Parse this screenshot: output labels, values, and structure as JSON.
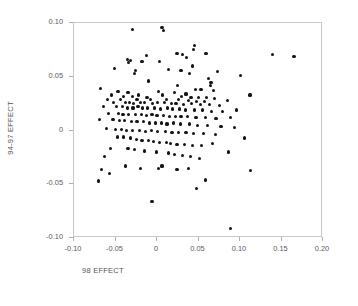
{
  "chart_data": {
    "type": "scatter",
    "title": "",
    "xlabel": "98 EFFECT",
    "ylabel": "94-97 EFFECT",
    "xlim": [
      -0.1,
      0.2
    ],
    "ylim": [
      -0.1,
      0.1
    ],
    "xticks": [
      -0.1,
      -0.05,
      0,
      0.05,
      0.1,
      0.15,
      0.2
    ],
    "xtick_labels": [
      "-0.10",
      "-0.05",
      "0",
      "0.05",
      "0.10",
      "0.15",
      "0.20"
    ],
    "yticks": [
      -0.1,
      -0.05,
      0,
      0.05,
      0.1
    ],
    "ytick_labels": [
      "-0.10",
      "-0.05",
      "0",
      "0.05",
      "0.10"
    ],
    "grid": false,
    "legend": "none",
    "marker": "filled-circle",
    "marker_color": "#141414",
    "frame_color": "#c8c8c8",
    "n_points": 182,
    "points": [
      [
        -0.03,
        0.094
      ],
      [
        0.006,
        0.096
      ],
      [
        0.008,
        0.093
      ],
      [
        0.045,
        0.079
      ],
      [
        0.044,
        0.075
      ],
      [
        0.139,
        0.071
      ],
      [
        0.165,
        0.069
      ],
      [
        0.024,
        0.072
      ],
      [
        0.059,
        0.072
      ],
      [
        0.031,
        0.071
      ],
      [
        -0.013,
        0.07
      ],
      [
        0.036,
        0.068
      ],
      [
        -0.036,
        0.066
      ],
      [
        -0.032,
        0.065
      ],
      [
        -0.018,
        0.064
      ],
      [
        0.003,
        0.064
      ],
      [
        -0.034,
        0.063
      ],
      [
        0.043,
        0.06
      ],
      [
        -0.051,
        0.058
      ],
      [
        -0.026,
        0.056
      ],
      [
        0.014,
        0.057
      ],
      [
        0.029,
        0.056
      ],
      [
        0.073,
        0.055
      ],
      [
        -0.027,
        0.053
      ],
      [
        0.039,
        0.053
      ],
      [
        0.101,
        0.051
      ],
      [
        0.062,
        0.048
      ],
      [
        -0.01,
        0.046
      ],
      [
        0.065,
        0.045
      ],
      [
        0.064,
        0.042
      ],
      [
        0.025,
        0.042
      ],
      [
        -0.068,
        0.039
      ],
      [
        0.046,
        0.038
      ],
      [
        0.053,
        0.038
      ],
      [
        0.068,
        0.037
      ],
      [
        -0.047,
        0.036
      ],
      [
        -0.035,
        0.035
      ],
      [
        0.002,
        0.036
      ],
      [
        0.021,
        0.035
      ],
      [
        0.035,
        0.034
      ],
      [
        0.112,
        0.033
      ],
      [
        -0.055,
        0.033
      ],
      [
        -0.04,
        0.032
      ],
      [
        -0.03,
        0.032
      ],
      [
        -0.022,
        0.033
      ],
      [
        -0.012,
        0.031
      ],
      [
        0.007,
        0.033
      ],
      [
        0.03,
        0.032
      ],
      [
        0.041,
        0.031
      ],
      [
        0.05,
        0.031
      ],
      [
        0.06,
        0.031
      ],
      [
        0.069,
        0.03
      ],
      [
        -0.06,
        0.029
      ],
      [
        -0.044,
        0.029
      ],
      [
        -0.024,
        0.029
      ],
      [
        -0.008,
        0.029
      ],
      [
        0.011,
        0.029
      ],
      [
        0.026,
        0.029
      ],
      [
        0.038,
        0.028
      ],
      [
        0.048,
        0.027
      ],
      [
        0.057,
        0.027
      ],
      [
        0.085,
        0.028
      ],
      [
        -0.052,
        0.026
      ],
      [
        -0.038,
        0.026
      ],
      [
        -0.033,
        0.026
      ],
      [
        -0.028,
        0.025
      ],
      [
        -0.02,
        0.026
      ],
      [
        -0.015,
        0.026
      ],
      [
        -0.005,
        0.025
      ],
      [
        0.001,
        0.026
      ],
      [
        0.009,
        0.026
      ],
      [
        0.017,
        0.025
      ],
      [
        0.023,
        0.025
      ],
      [
        0.032,
        0.024
      ],
      [
        0.042,
        0.025
      ],
      [
        0.052,
        0.024
      ],
      [
        0.063,
        0.024
      ],
      [
        0.075,
        0.023
      ],
      [
        -0.064,
        0.022
      ],
      [
        -0.049,
        0.022
      ],
      [
        -0.042,
        0.022
      ],
      [
        -0.036,
        0.021
      ],
      [
        -0.029,
        0.021
      ],
      [
        -0.023,
        0.022
      ],
      [
        -0.017,
        0.021
      ],
      [
        -0.011,
        0.021
      ],
      [
        -0.003,
        0.021
      ],
      [
        0.004,
        0.02
      ],
      [
        0.013,
        0.021
      ],
      [
        0.019,
        0.02
      ],
      [
        0.027,
        0.02
      ],
      [
        0.034,
        0.019
      ],
      [
        0.045,
        0.019
      ],
      [
        0.055,
        0.019
      ],
      [
        0.066,
        0.018
      ],
      [
        0.079,
        0.018
      ],
      [
        0.096,
        0.019
      ],
      [
        -0.058,
        0.016
      ],
      [
        -0.046,
        0.016
      ],
      [
        -0.041,
        0.015
      ],
      [
        -0.034,
        0.015
      ],
      [
        -0.026,
        0.015
      ],
      [
        -0.019,
        0.015
      ],
      [
        -0.013,
        0.014
      ],
      [
        -0.006,
        0.015
      ],
      [
        0.0,
        0.014
      ],
      [
        0.008,
        0.014
      ],
      [
        0.015,
        0.013
      ],
      [
        0.022,
        0.013
      ],
      [
        0.029,
        0.013
      ],
      [
        0.037,
        0.013
      ],
      [
        0.047,
        0.012
      ],
      [
        0.058,
        0.012
      ],
      [
        0.071,
        0.011
      ],
      [
        0.089,
        0.012
      ],
      [
        -0.069,
        0.01
      ],
      [
        -0.053,
        0.01
      ],
      [
        -0.045,
        0.009
      ],
      [
        -0.039,
        0.009
      ],
      [
        -0.031,
        0.008
      ],
      [
        -0.024,
        0.008
      ],
      [
        -0.016,
        0.008
      ],
      [
        -0.009,
        0.007
      ],
      [
        -0.002,
        0.007
      ],
      [
        0.005,
        0.007
      ],
      [
        0.012,
        0.006
      ],
      [
        0.02,
        0.007
      ],
      [
        0.028,
        0.006
      ],
      [
        0.039,
        0.006
      ],
      [
        0.049,
        0.005
      ],
      [
        0.061,
        0.005
      ],
      [
        0.077,
        0.004
      ],
      [
        0.093,
        0.003
      ],
      [
        -0.061,
        0.002
      ],
      [
        -0.05,
        0.001
      ],
      [
        -0.043,
        0.001
      ],
      [
        -0.037,
        0.0
      ],
      [
        -0.03,
        0.0
      ],
      [
        -0.021,
        0.0
      ],
      [
        -0.014,
        -0.001
      ],
      [
        -0.007,
        0.0
      ],
      [
        0.001,
        -0.001
      ],
      [
        0.01,
        -0.001
      ],
      [
        0.018,
        -0.002
      ],
      [
        0.026,
        -0.002
      ],
      [
        0.035,
        -0.002
      ],
      [
        0.044,
        -0.003
      ],
      [
        0.056,
        -0.003
      ],
      [
        0.07,
        -0.004
      ],
      [
        0.105,
        -0.007
      ],
      [
        -0.048,
        -0.006
      ],
      [
        -0.04,
        -0.006
      ],
      [
        -0.032,
        -0.007
      ],
      [
        -0.025,
        -0.008
      ],
      [
        -0.018,
        -0.009
      ],
      [
        -0.01,
        -0.009
      ],
      [
        -0.004,
        -0.01
      ],
      [
        0.003,
        -0.011
      ],
      [
        0.011,
        -0.011
      ],
      [
        0.016,
        -0.012
      ],
      [
        0.024,
        -0.013
      ],
      [
        0.033,
        -0.013
      ],
      [
        0.043,
        -0.014
      ],
      [
        0.054,
        -0.014
      ],
      [
        0.067,
        -0.012
      ],
      [
        0.086,
        -0.02
      ],
      [
        -0.056,
        -0.017
      ],
      [
        -0.035,
        -0.017
      ],
      [
        -0.027,
        -0.018
      ],
      [
        -0.015,
        -0.019
      ],
      [
        -0.001,
        -0.02
      ],
      [
        0.014,
        -0.021
      ],
      [
        0.021,
        -0.022
      ],
      [
        0.031,
        -0.023
      ],
      [
        0.04,
        -0.024
      ],
      [
        0.051,
        -0.026
      ],
      [
        -0.063,
        -0.024
      ],
      [
        0.006,
        -0.033
      ],
      [
        -0.02,
        -0.035
      ],
      [
        0.002,
        -0.035
      ],
      [
        -0.038,
        -0.033
      ],
      [
        -0.067,
        -0.036
      ],
      [
        -0.057,
        -0.04
      ],
      [
        0.024,
        -0.036
      ],
      [
        0.038,
        -0.035
      ],
      [
        0.113,
        -0.037
      ],
      [
        -0.07,
        -0.047
      ],
      [
        0.058,
        -0.046
      ],
      [
        0.048,
        -0.054
      ],
      [
        -0.006,
        -0.066
      ],
      [
        0.089,
        -0.091
      ]
    ]
  },
  "axis_titles": {
    "x": "98 EFFECT",
    "y": "94-97 EFFECT"
  }
}
